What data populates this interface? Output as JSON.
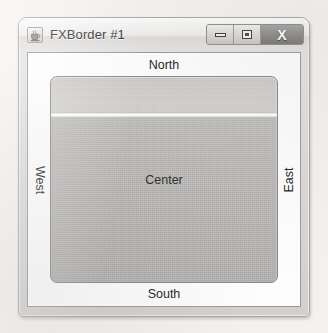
{
  "window": {
    "title": "FXBorder #1",
    "icon": "java-duke-icon",
    "buttons": [
      {
        "name": "minimize-button",
        "label": "–",
        "glyph": "minimize-icon"
      },
      {
        "name": "maximize-button",
        "label": "□",
        "glyph": "maximize-icon"
      },
      {
        "name": "close-button",
        "label": "X",
        "glyph": "close-icon"
      }
    ]
  },
  "border_pane": {
    "north": "North",
    "south": "South",
    "west": "West",
    "east": "East",
    "center": "Center"
  },
  "colors": {
    "page_background": "#f4f2f0",
    "frame_background": "#dedcda",
    "frame_border": "#a7a5a3",
    "titlebar_text": "#2e2c2b",
    "client_background": "#fdfdfd",
    "client_border": "#9b9997",
    "center_panel_fill": "#b2b0ae",
    "center_panel_border": "#8b8987",
    "close_button_fill": "#8d8b89",
    "label_text": "#1f1e1d"
  }
}
